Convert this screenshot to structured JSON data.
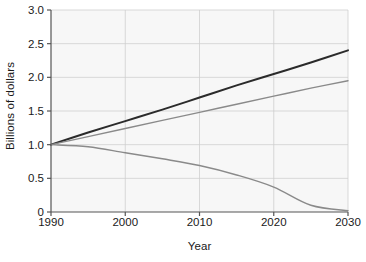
{
  "chart_data": {
    "type": "line",
    "title": "",
    "xlabel": "Year",
    "ylabel": "Billions of dollars",
    "xlim": [
      1990,
      2030
    ],
    "ylim": [
      0,
      3.0
    ],
    "grid": true,
    "legend": "none",
    "xticks": [
      "1990",
      "2000",
      "2010",
      "2020",
      "2030"
    ],
    "xtick_values": [
      1990,
      2000,
      2010,
      2020,
      2030
    ],
    "yticks": [
      "0",
      "0.5",
      "1.0",
      "1.5",
      "2.0",
      "2.5",
      "3.0"
    ],
    "ytick_values": [
      0,
      0.5,
      1.0,
      1.5,
      2.0,
      2.5,
      3.0
    ],
    "plot_bgcolor": "#f7f7f7",
    "grid_color": "#cfcfcf",
    "axis_color": "#555555",
    "x": [
      1990,
      1995,
      2000,
      2005,
      2010,
      2015,
      2020,
      2025,
      2030
    ],
    "series": [
      {
        "name": "upper",
        "color": "#2b2b2b",
        "width": 2.0,
        "values": [
          1.0,
          1.18,
          1.35,
          1.52,
          1.7,
          1.88,
          2.05,
          2.22,
          2.4
        ]
      },
      {
        "name": "middle",
        "color": "#8a8a8a",
        "width": 1.4,
        "values": [
          1.0,
          1.12,
          1.24,
          1.36,
          1.48,
          1.6,
          1.72,
          1.84,
          1.95
        ]
      },
      {
        "name": "lower",
        "color": "#8a8a8a",
        "width": 1.4,
        "values": [
          1.0,
          0.97,
          0.88,
          0.79,
          0.69,
          0.55,
          0.37,
          0.1,
          0.02
        ]
      }
    ]
  }
}
